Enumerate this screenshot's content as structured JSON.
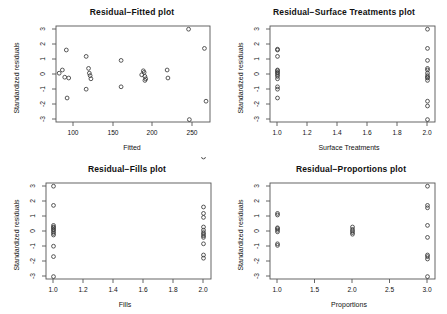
{
  "figure": {
    "layout": "2x2 panel of residual diagnostic scatter plots",
    "background": "#ffffff",
    "point_symbol": "open-circle",
    "point_color": "#3b3b3b",
    "axis_color": "#555555"
  },
  "chart_data": [
    {
      "type": "scatter",
      "title": "Residual−Fitted plot",
      "xlabel": "Fitted",
      "ylabel": "Standardized residuals",
      "xlim": [
        78,
        272
      ],
      "ylim": [
        -3,
        3
      ],
      "xticks": [
        100,
        150,
        200,
        250
      ],
      "xtick_labels": [
        "100",
        "150",
        "200",
        "250"
      ],
      "yticks": [
        -3,
        -2,
        -1,
        0,
        1,
        2,
        3
      ],
      "ytick_labels": [
        "-3",
        "-2",
        "-1",
        "0",
        "1",
        "2",
        "3"
      ],
      "grid": false,
      "legend": false,
      "x": [
        82,
        86,
        89,
        91,
        92,
        94,
        116,
        116,
        119,
        120,
        121,
        122,
        160,
        160,
        186,
        188,
        189,
        190,
        190,
        191,
        218,
        219,
        245,
        246,
        265,
        267
      ],
      "y": [
        0.05,
        0.25,
        -0.2,
        1.5,
        -1.5,
        -0.25,
        1.1,
        -0.95,
        0.35,
        0.05,
        -0.1,
        -0.3,
        0.85,
        -0.8,
        -0.05,
        0.2,
        0.1,
        -0.15,
        -0.4,
        -0.3,
        0.25,
        -0.25,
        2.8,
        -2.85,
        1.6,
        -1.7
      ]
    },
    {
      "type": "scatter",
      "title": "Residual−Surface Treatments plot",
      "xlabel": "Surface Treatments",
      "ylabel": "Standardized residuals",
      "xlim": [
        0.95,
        2.05
      ],
      "ylim": [
        -3,
        3
      ],
      "xticks": [
        1.0,
        1.2,
        1.4,
        1.6,
        1.8,
        2.0
      ],
      "xtick_labels": [
        "1.0",
        "1.2",
        "1.4",
        "1.6",
        "1.8",
        "2.0"
      ],
      "yticks": [
        -3,
        -2,
        -1,
        0,
        1,
        2,
        3
      ],
      "ytick_labels": [
        "-3",
        "-2",
        "-1",
        "0",
        "1",
        "2",
        "3"
      ],
      "grid": false,
      "legend": false,
      "x": [
        1,
        1,
        1,
        1,
        1,
        1,
        1,
        1,
        1,
        1,
        1,
        1,
        1,
        2,
        2,
        2,
        2,
        2,
        2,
        2,
        2,
        2,
        2,
        2,
        2,
        2
      ],
      "y": [
        1.55,
        1.5,
        1.1,
        0.25,
        0.2,
        0.1,
        0.05,
        -0.05,
        -0.15,
        -0.3,
        -0.8,
        -0.95,
        -1.5,
        2.8,
        1.6,
        0.85,
        0.35,
        0.25,
        0.05,
        -0.1,
        -0.2,
        -0.25,
        -0.4,
        -1.7,
        -2.0,
        -2.85
      ]
    },
    {
      "type": "scatter",
      "title": "Residual−Fills plot",
      "xlabel": "Fills",
      "ylabel": "Standardized residuals",
      "xlim": [
        0.95,
        2.05
      ],
      "ylim": [
        -3,
        3
      ],
      "xticks": [
        1.0,
        1.2,
        1.4,
        1.6,
        1.8,
        2.0
      ],
      "xtick_labels": [
        "1.0",
        "1.2",
        "1.4",
        "1.6",
        "1.8",
        "2.0"
      ],
      "yticks": [
        -3,
        -2,
        -1,
        0,
        1,
        2,
        3
      ],
      "ytick_labels": [
        "-3",
        "-2",
        "-1",
        "0",
        "1",
        "2",
        "3"
      ],
      "grid": false,
      "legend": false,
      "x": [
        1,
        1,
        1,
        1,
        1,
        1,
        1,
        1,
        1,
        1,
        1,
        1,
        1,
        2,
        2,
        2,
        2,
        2,
        2,
        2,
        2,
        2,
        2,
        2,
        2,
        2
      ],
      "y": [
        2.8,
        1.6,
        0.35,
        0.25,
        0.1,
        0.05,
        -0.05,
        -0.15,
        -0.25,
        -0.95,
        -1.6,
        -2.85,
        0.2,
        1.5,
        1.1,
        0.85,
        0.25,
        0.05,
        -0.1,
        -0.2,
        -0.3,
        -0.4,
        -0.8,
        -1.5,
        -1.7
      ]
    },
    {
      "type": "scatter",
      "title": "Residual−Proportions plot",
      "xlabel": "Proportions",
      "ylabel": "Standardized residuals",
      "xlim": [
        0.9,
        3.1
      ],
      "ylim": [
        -3,
        3
      ],
      "xticks": [
        1.0,
        1.5,
        2.0,
        2.5,
        3.0
      ],
      "xtick_labels": [
        "1.0",
        "1.5",
        "2.0",
        "2.5",
        "3.0"
      ],
      "yticks": [
        -3,
        -2,
        -1,
        0,
        1,
        2,
        3
      ],
      "ytick_labels": [
        "-3",
        "-2",
        "-1",
        "0",
        "1",
        "2",
        "3"
      ],
      "grid": false,
      "legend": false,
      "x": [
        1,
        1,
        1,
        1,
        1,
        1,
        1,
        1,
        2,
        2,
        2,
        2,
        2,
        3,
        3,
        3,
        3,
        3,
        3,
        3,
        3,
        3
      ],
      "y": [
        1.1,
        1.0,
        0.15,
        0.05,
        -0.05,
        -0.8,
        -0.9,
        0.2,
        0.25,
        0.1,
        0.0,
        -0.1,
        -0.2,
        2.8,
        1.6,
        1.45,
        0.35,
        -0.4,
        -1.6,
        -1.75,
        -2.85,
        -1.5
      ]
    }
  ]
}
